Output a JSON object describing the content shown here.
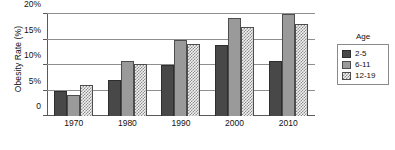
{
  "chart_data": {
    "type": "bar",
    "title": "",
    "xlabel": "",
    "ylabel": "Obesity Rate (%)",
    "categories": [
      "1970",
      "1980",
      "1990",
      "2000",
      "2010"
    ],
    "series": [
      {
        "name": "2-5",
        "values": [
          5.0,
          7.0,
          10.0,
          14.0,
          10.7
        ]
      },
      {
        "name": "6-11",
        "values": [
          4.2,
          10.7,
          15.0,
          19.2,
          20.0
        ]
      },
      {
        "name": "12-19",
        "values": [
          6.0,
          10.2,
          14.2,
          17.5,
          18.0
        ]
      }
    ],
    "ylim": [
      0,
      20
    ],
    "yticks": [
      0,
      5,
      10,
      15,
      20
    ],
    "ytick_labels": [
      "0",
      "5%",
      "10%",
      "15%",
      "20%"
    ],
    "grid": true,
    "legend_position": "right",
    "legend_title": "Age"
  },
  "axis": {
    "y_title": "Obesity Rate (%)"
  },
  "legend": {
    "title": "Age",
    "items": [
      {
        "label": "2-5"
      },
      {
        "label": "6-11"
      },
      {
        "label": "12-19"
      }
    ]
  },
  "colors": {
    "series_0": "#484848",
    "series_1": "#9a9a9a",
    "series_2": "#f2f2f2",
    "gridline": "#8e8e8e",
    "axis": "#5a5a5a",
    "background": "#ffffff"
  }
}
